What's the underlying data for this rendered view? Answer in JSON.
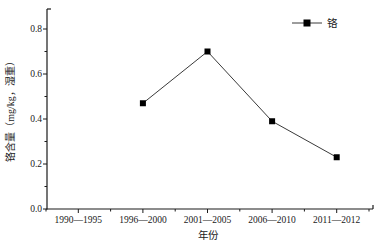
{
  "chart_data": {
    "type": "line",
    "title": "",
    "xlabel": "年份",
    "ylabel": "铬含量（mg/kg，湿重）",
    "categories": [
      "1990—1995",
      "1996—2000",
      "2001—2005",
      "2006—2010",
      "2011—2012"
    ],
    "series": [
      {
        "name": "铬",
        "values": [
          null,
          0.47,
          0.7,
          0.39,
          0.23
        ],
        "marker": "filled-square"
      }
    ],
    "ylim": [
      0.0,
      0.8
    ],
    "y_tick_values": [
      0.0,
      0.2,
      0.4,
      0.6,
      0.8
    ],
    "y_tick_labels": [
      "0.0",
      "0.2",
      "0.4",
      "0.6",
      "0.8"
    ],
    "y_minor_tick_values": [
      0.1,
      0.3,
      0.5,
      0.7
    ],
    "grid": "off",
    "legend_position": "top-right",
    "colors": {
      "axis": "#1a1a1a",
      "series_line": "#3a3a3a",
      "marker": "#000000",
      "text": "#1a1a1a",
      "background": "#ffffff"
    }
  }
}
